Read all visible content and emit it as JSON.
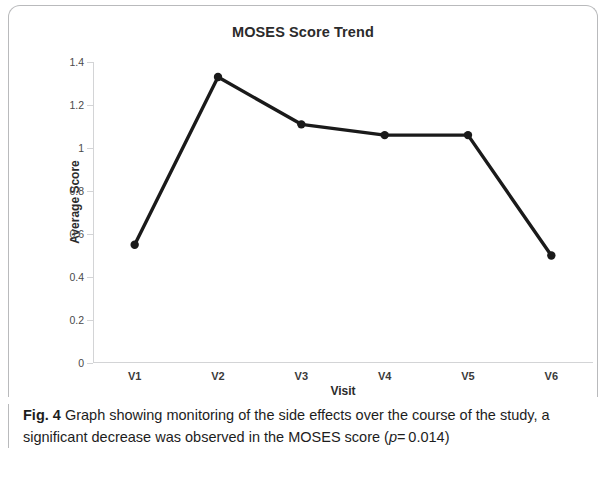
{
  "chart_data": {
    "type": "line",
    "title": "MOSES Score Trend",
    "xlabel": "Visit",
    "ylabel": "Average Score",
    "categories": [
      "V1",
      "V2",
      "V3",
      "V4",
      "V5",
      "V6"
    ],
    "values": [
      0.55,
      1.33,
      1.11,
      1.06,
      1.06,
      0.5
    ],
    "series": [
      {
        "name": "Average Score",
        "values": [
          0.55,
          1.33,
          1.11,
          1.06,
          1.06,
          0.5
        ]
      }
    ],
    "ylim": [
      0,
      1.4
    ],
    "y_ticks": [
      "0",
      "0.2",
      "0.4",
      "0.6",
      "0.8",
      "1",
      "1.2",
      "1.4"
    ],
    "y_tick_values": [
      0,
      0.2,
      0.4,
      0.6,
      0.8,
      1.0,
      1.2,
      1.4
    ],
    "grid": false,
    "legend": "none",
    "line_color": "#1a1a1a",
    "marker_color": "#1a1a1a",
    "axis_color": "#d3d4d6"
  },
  "caption": {
    "label": "Fig. 4",
    "text_part1": "Graph showing monitoring of the side effects over the course of the study, a significant decrease was observed in the MOSES score (",
    "p_symbol": "p",
    "p_value": "= 0.014",
    "text_part2": ")"
  }
}
